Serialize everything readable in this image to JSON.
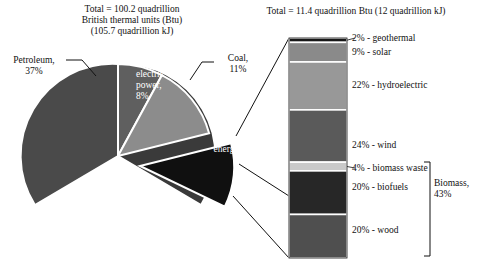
{
  "pie_title": "Total = 100.2 quadrillion\nBritish thermal units (Btu)\n(105.7 quadrillion kJ)",
  "bar_title": "Total = 11.4 quadrillion Btu (12 quadrillion kJ)",
  "labels": {
    "petroleum": "Petroleum,\n37%",
    "nuclear": "Nuclear\nelectric\npower,\n8%",
    "coal": "Coal,\n11%",
    "natural_gas": "Natural gas,\n32%",
    "renewable": "Renewable\nenergy, 11%",
    "biomass_bracket": "Biomass,\n43%"
  },
  "chart_data": [
    {
      "type": "pie",
      "title": "Total = 100.2 quadrillion British thermal units (Btu) (105.7 quadrillion kJ)",
      "total_btu_quadrillion": 100.2,
      "total_kj_quadrillion": 105.7,
      "unit": "%",
      "exploded_slice": "Renewable energy",
      "categories": [
        "Petroleum",
        "Natural gas",
        "Coal",
        "Renewable energy",
        "Nuclear electric power"
      ],
      "values": [
        37,
        32,
        11,
        11,
        8
      ],
      "colors": [
        "#4a4a4a",
        "#3a3a3a",
        "#8c8c8c",
        "#101010",
        "#5f5f5f"
      ],
      "labels": [
        "Petroleum, 37%",
        "Natural gas, 32%",
        "Coal, 11%",
        "Renewable energy, 11%",
        "Nuclear electric power, 8%"
      ]
    },
    {
      "type": "bar",
      "orientation": "stacked-vertical",
      "title": "Total = 11.4 quadrillion Btu (12 quadrillion kJ)",
      "total_btu_quadrillion": 11.4,
      "total_kj_quadrillion": 12,
      "unit": "%",
      "note": "Breakdown of the Renewable energy slice (11% of total)",
      "categories": [
        "geothermal",
        "solar",
        "hydroelectric",
        "wind",
        "biomass waste",
        "biofuels",
        "wood"
      ],
      "values": [
        2,
        9,
        22,
        24,
        4,
        20,
        20
      ],
      "colors": [
        "#171717",
        "#8a8a8a",
        "#989898",
        "#5a5a5a",
        "#c9c9c9",
        "#272727",
        "#4f4f4f"
      ],
      "labels": [
        "2% - geothermal",
        "9% - solar",
        "22% - hydroelectric",
        "24% - wind",
        "4% - biomass waste",
        "20% - biofuels",
        "20% - wood"
      ],
      "grouping": {
        "name": "Biomass",
        "value": 43,
        "members": [
          "biomass waste",
          "biofuels",
          "wood"
        ],
        "label": "Biomass, 43%"
      }
    }
  ]
}
